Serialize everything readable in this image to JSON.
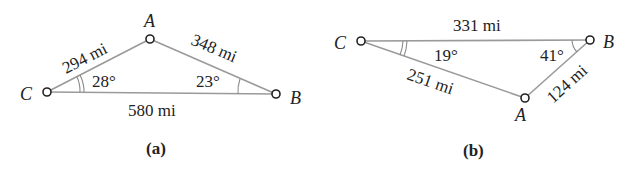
{
  "figures": [
    {
      "caption": "(a)",
      "vertices": {
        "A": {
          "label": "A"
        },
        "B": {
          "label": "B"
        },
        "C": {
          "label": "C"
        }
      },
      "sides": {
        "CA": "294 mi",
        "AB": "348 mi",
        "CB": "580 mi"
      },
      "angles": {
        "C": "28°",
        "B": "23°"
      }
    },
    {
      "caption": "(b)",
      "vertices": {
        "A": {
          "label": "A"
        },
        "B": {
          "label": "B"
        },
        "C": {
          "label": "C"
        }
      },
      "sides": {
        "CB": "331 mi",
        "CA": "251 mi",
        "AB": "124 mi"
      },
      "angles": {
        "C": "19°",
        "B": "41°"
      }
    }
  ],
  "colors": {
    "edge": "#9a9a9a",
    "text": "#222222"
  }
}
